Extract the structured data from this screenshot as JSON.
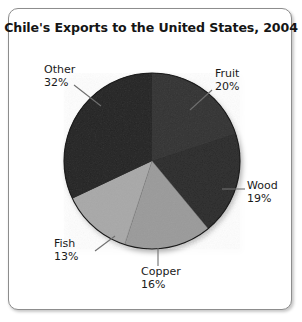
{
  "chart_data": {
    "type": "pie",
    "title": "Chile's Exports to the United States, 2004",
    "categories": [
      "Fruit",
      "Wood",
      "Copper",
      "Fish",
      "Other"
    ],
    "values": [
      20,
      19,
      16,
      13,
      32
    ],
    "unit": "%",
    "labels": [
      "20%",
      "19%",
      "16%",
      "13%",
      "32%"
    ],
    "start_angle_deg": 0,
    "direction": "clockwise",
    "legend": "none",
    "grid": false,
    "slice_colors": [
      "#333333",
      "#2b2b2b",
      "#9a9a9a",
      "#a8a8a8",
      "#252525"
    ],
    "slices": [
      {
        "name": "Fruit",
        "percent": 20,
        "label": "Fruit",
        "value_label": "20%",
        "color": "#333333",
        "start_deg": 0.0,
        "end_deg": 72.0
      },
      {
        "name": "Wood",
        "percent": 19,
        "label": "Wood",
        "value_label": "19%",
        "color": "#2b2b2b",
        "start_deg": 72.0,
        "end_deg": 140.4
      },
      {
        "name": "Copper",
        "percent": 16,
        "label": "Copper",
        "value_label": "16%",
        "color": "#9a9a9a",
        "start_deg": 140.4,
        "end_deg": 198.0
      },
      {
        "name": "Fish",
        "percent": 13,
        "label": "Fish",
        "value_label": "13%",
        "color": "#a8a8a8",
        "start_deg": 198.0,
        "end_deg": 244.8
      },
      {
        "name": "Other",
        "percent": 32,
        "label": "Other",
        "value_label": "32%",
        "color": "#252525",
        "start_deg": 244.8,
        "end_deg": 360.0
      }
    ]
  },
  "frame": {
    "border_color": "#8d8d8d",
    "background": "#ffffff"
  }
}
